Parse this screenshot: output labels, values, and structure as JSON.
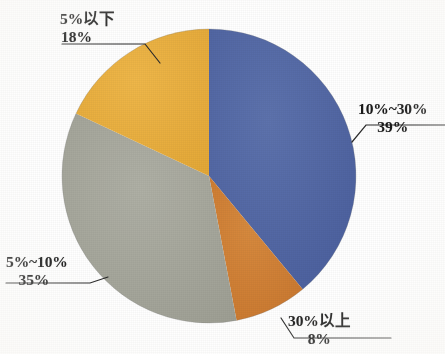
{
  "chart_data": {
    "type": "pie",
    "title": "",
    "subtitle": "",
    "xlabel": "",
    "ylabel": "",
    "legend_position": "none",
    "grid": false,
    "units": "%",
    "start_angle_deg": 0,
    "direction": "clockwise",
    "categories": [
      "10%~30%",
      "30%以上",
      "5%~10%",
      "5%以下"
    ],
    "values": [
      39,
      8,
      35,
      18
    ],
    "colors": [
      "#5066a4",
      "#cf7f34",
      "#a6a79b",
      "#e9ae3d"
    ],
    "slices": [
      {
        "label": "10%~30%",
        "value_label": "39%",
        "value": 39,
        "color": "#5066a4"
      },
      {
        "label": "30%以上",
        "value_label": "8%",
        "value": 8,
        "color": "#cf7f34"
      },
      {
        "label": "5%~10%",
        "value_label": "35%",
        "value": 35,
        "color": "#a6a79b"
      },
      {
        "label": "5%以下",
        "value_label": "18%",
        "value": 18,
        "color": "#e9ae3d"
      }
    ],
    "annotations": [
      {
        "name": "leader-line-10to30",
        "for": "10%~30%"
      },
      {
        "name": "leader-line-over30",
        "for": "30%以上"
      },
      {
        "name": "leader-line-5to10",
        "for": "5%~10%"
      },
      {
        "name": "leader-line-below5",
        "for": "5%以下"
      }
    ]
  },
  "labels": {
    "below5": {
      "category": "5%以下",
      "value": "18%"
    },
    "ten_to_thirty": {
      "category": "10%~30%",
      "value": "39%"
    },
    "over30": {
      "category": "30%以上",
      "value": "8%"
    },
    "five_to_ten": {
      "category": "5%~10%",
      "value": "35%"
    }
  },
  "style": {
    "background": "#ffffff",
    "text_color": "#1a1a1a",
    "leader_color": "#2b2b2b"
  }
}
